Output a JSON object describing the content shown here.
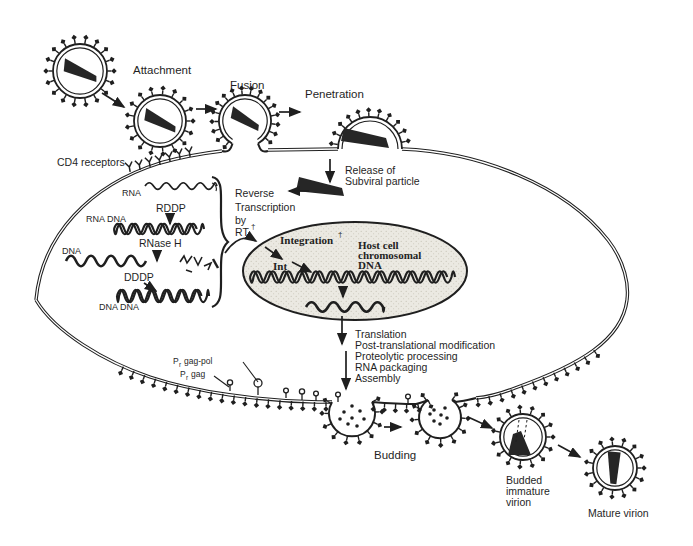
{
  "colors": {
    "ink": "#1f1f1f",
    "core": "#262626",
    "paper": "#ffffff",
    "nucleus_fill": "#ebe9e2",
    "nucleus_dot": "#c9c5b8"
  },
  "labels": {
    "attachment": "Attachment",
    "fusion": "Fusion",
    "penetration": "Penetration",
    "cd4": "CD4 receptors",
    "release_1": "Release of",
    "release_2": "Subviral particle",
    "reverse_1": "Reverse",
    "reverse_2": "Transcription",
    "reverse_3": "by",
    "reverse_4": "RT",
    "dagger": "†",
    "rna": "RNA",
    "rddp": "RDDP",
    "rna_dna": "RNA DNA",
    "rnase_h": "RNase H",
    "dna": "DNA",
    "dddp": "DDDP",
    "dna_dna": "DNA DNA",
    "integration": "Integration",
    "int": "Int",
    "host_1": "Host cell",
    "host_2": "chromosomal",
    "host_3": "DNA",
    "budding": "Budding",
    "budded_1": "Budded",
    "budded_2": "immature",
    "budded_3": "virion",
    "mature": "Mature virion",
    "pr_p": "P",
    "pr_sub": "r",
    "gagpol": "gag-pol",
    "gag": "gag"
  },
  "translation_steps": [
    "Translation",
    "Post-translational modification",
    "Proteolytic processing",
    "RNA packaging",
    "Assembly"
  ]
}
